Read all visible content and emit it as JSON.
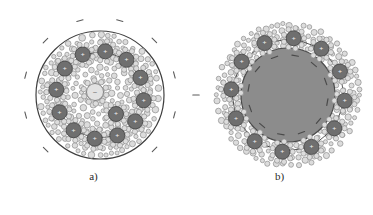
{
  "figure": {
    "caption_a": "a)",
    "caption_b": "b)",
    "panel_a_name": "micelle-cross-section-diffuse",
    "panel_b_name": "micelle-cross-section-solid-core",
    "cation_symbol": "+",
    "anion_symbol": "−",
    "colors": {
      "background": "#ffffff",
      "outline": "#3f3f3f",
      "cation_fill": "#6f6f6f",
      "cation_stroke": "#4a4a4a",
      "solvent_fill": "#dcdcdc",
      "solvent_stroke": "#8c8c8c",
      "core_fill": "#8c8c8c",
      "core_stroke": "#4a4a4a",
      "free_anion_fill": "#e2e2e2",
      "free_anion_stroke": "#7a7a7a",
      "minus_sign": "#5a5a5a",
      "label_text": "#2a2a2a"
    },
    "panel_a": {
      "outer_circle": {
        "cx": 100,
        "cy": 95,
        "r": 64
      },
      "ring_ions_count": 12,
      "ring_ion_radius": 44,
      "ring_ion_size": 7.5,
      "extra_ions": [
        {
          "cx": 116,
          "cy": 114,
          "r": 7.5,
          "label": "+"
        }
      ],
      "free_anion": {
        "cx": 95,
        "cy": 92,
        "r": 8.5,
        "label": "−"
      },
      "external_minus_count": 12,
      "external_minus_radius": 77,
      "solvent_count": 430,
      "solvent_radius_range": [
        2.0,
        3.4
      ]
    },
    "panel_b": {
      "outer_extent": {
        "cx": 288,
        "cy": 95,
        "r": 72
      },
      "core_circle": {
        "cx": 288,
        "cy": 95,
        "r": 47
      },
      "ring_ions_count": 12,
      "ring_ion_radius": 57,
      "ring_ion_size": 7.5,
      "core_minus_count": 12,
      "core_minus_radius": 40,
      "external_minus": [
        {
          "x": 196,
          "y": 95
        }
      ],
      "solvent_count": 300,
      "solvent_radius_range": [
        2.0,
        3.2
      ],
      "shell_inner_radius": 48,
      "shell_outer_radius": 72
    }
  }
}
